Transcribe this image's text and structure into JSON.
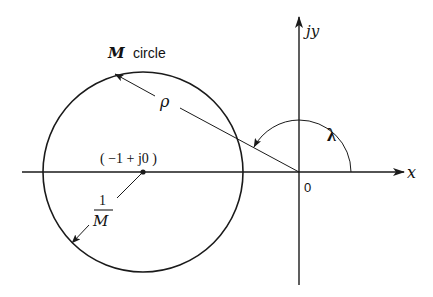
{
  "diagram": {
    "labels": {
      "circle_name_var": "M",
      "circle_name_word": "circle",
      "radius": "ρ",
      "angle": "λ",
      "center_point": "( −1 + j0 )",
      "inv_m_numerator": "1",
      "inv_m_denominator": "M",
      "origin": "0",
      "x_axis": "x",
      "y_axis": "jy"
    },
    "colors": {
      "stroke": "#1a1a1a",
      "background": "#ffffff"
    },
    "geometry": {
      "origin": [
        299,
        172
      ],
      "circle_center": [
        143,
        172
      ],
      "circle_radius": 100,
      "angle_arc_radius": 52
    }
  }
}
